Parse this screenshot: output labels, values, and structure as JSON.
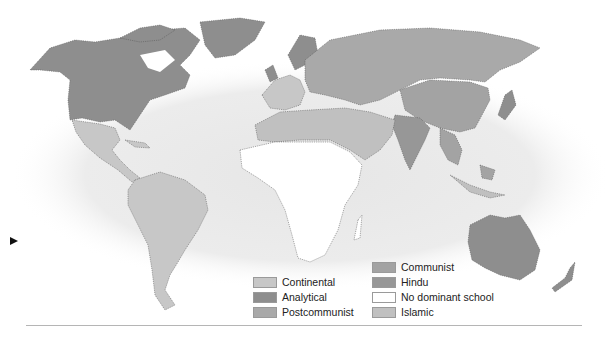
{
  "map": {
    "title": "",
    "colors": {
      "background_glow": "#e9e9e9",
      "continental": "#c7c7c7",
      "analytical": "#8e8e8e",
      "postcommunist": "#a9a9a9",
      "communist": "#a3a3a3",
      "hindu": "#979797",
      "no_dominant_school": "#ffffff",
      "islamic": "#c0c0c0",
      "border": "#555555"
    },
    "regions": {
      "north_america_us_canada": "analytical",
      "greenland": "analytical",
      "mexico_central_america": "continental",
      "south_america": "continental",
      "western_europe": "continental",
      "uk_scandinavia": "analytical",
      "russia_eastern_europe": "postcommunist",
      "china": "communist",
      "india": "hindu",
      "southeast_asia": "communist",
      "north_africa_middle_east": "islamic",
      "sub_saharan_africa": "no_dominant_school",
      "australia_new_zealand": "analytical",
      "japan": "analytical"
    }
  },
  "legend": {
    "items": [
      {
        "key": "continental",
        "label": "Continental",
        "color": "#c7c7c7"
      },
      {
        "key": "analytical",
        "label": "Analytical",
        "color": "#8e8e8e"
      },
      {
        "key": "postcommunist",
        "label": "Postcommunist",
        "color": "#a9a9a9"
      },
      {
        "key": "communist",
        "label": "Communist",
        "color": "#a3a3a3"
      },
      {
        "key": "hindu",
        "label": "Hindu",
        "color": "#979797"
      },
      {
        "key": "no_dominant_school",
        "label": "No dominant school",
        "color": "#ffffff"
      },
      {
        "key": "islamic",
        "label": "Islamic",
        "color": "#c0c0c0"
      }
    ]
  },
  "pointer": {
    "icon": "triangle-right-icon"
  }
}
